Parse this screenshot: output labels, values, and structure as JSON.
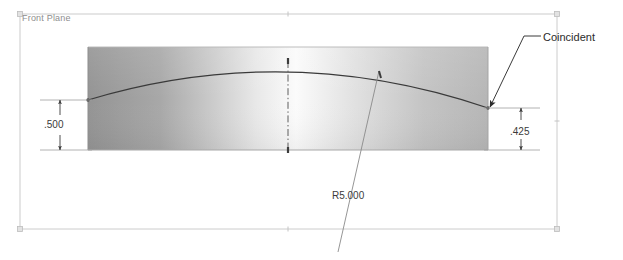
{
  "app": {
    "kind": "cad-sketch-viewport",
    "background_color": "#ffffff"
  },
  "plane": {
    "label": "Front Plane",
    "border_color": "#c9c9c9",
    "label_color": "#8e8e8e",
    "bounds": {
      "x": 20,
      "y": 14,
      "width": 537,
      "height": 215
    }
  },
  "part": {
    "name": "extruded-plate",
    "fill_left_color": "#9a9a9a",
    "fill_center_color": "#fafafa",
    "fill_right_color": "#bdbdbd",
    "bounds": {
      "x": 88,
      "y": 47,
      "width": 400,
      "height": 103
    }
  },
  "geometry": {
    "arc": {
      "name": "top-arc",
      "radius_label": "R5.000",
      "color": "#333333",
      "start": {
        "x": 88,
        "y": 100
      },
      "apex": {
        "x": 288,
        "y": 61
      },
      "end": {
        "x": 488,
        "y": 108
      }
    },
    "centerline": {
      "name": "vertical-centerline",
      "color": "#555555",
      "style": "dash-dot",
      "x": 288,
      "y_top": 61,
      "y_bottom": 150
    }
  },
  "dimensions": [
    {
      "id": "left-height",
      "name": "dimension-left-height",
      "value": ".500",
      "x": 60,
      "y_top": 100,
      "y_bottom": 150
    },
    {
      "id": "right-height",
      "name": "dimension-right-height",
      "value": ".425",
      "x": 521,
      "y_top": 108,
      "y_bottom": 150
    },
    {
      "id": "arc-radius",
      "name": "dimension-arc-radius",
      "value": "R5.000",
      "leader_from": {
        "x": 338,
        "y": 246
      },
      "leader_to": {
        "x": 379,
        "y": 71
      }
    }
  ],
  "annotations": [
    {
      "id": "coincident",
      "name": "annotation-coincident",
      "label": "Coincident",
      "color": "#2b2b2b",
      "arrow_tip": {
        "x": 488,
        "y": 108
      },
      "elbow": {
        "x": 524,
        "y": 36
      },
      "shelf_end": {
        "x": 541,
        "y": 36
      }
    }
  ],
  "colors": {
    "line": "#333333",
    "dimension": "#3b3b3b",
    "plane_border": "#c9c9c9",
    "extension_line": "#9c9c9c"
  }
}
